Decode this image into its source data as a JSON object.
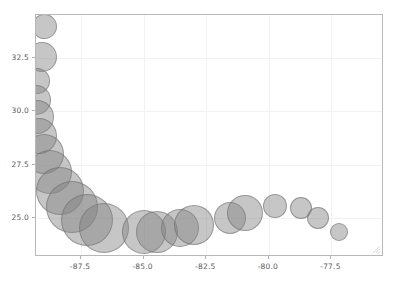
{
  "chart_data": {
    "type": "scatter",
    "title": "",
    "subtitle": "",
    "xlabel": "",
    "ylabel": "",
    "grid": true,
    "legend": false,
    "legend_position": "none",
    "marker_style": "bubble",
    "marker_color": "#808080",
    "marker_opacity": 0.45,
    "marker_edge_color": "#6e6e6e",
    "xlim": [
      -89.3,
      -75.4
    ],
    "ylim": [
      23.2,
      34.5
    ],
    "xticks": [
      -87.5,
      -85.0,
      -82.5,
      -80.0,
      -77.5
    ],
    "xticklabels": [
      "-87.5",
      "-85.0",
      "-82.5",
      "-80.0",
      "-77.5"
    ],
    "yticks": [
      25.0,
      27.5,
      30.0,
      32.5
    ],
    "yticklabels": [
      "25.0",
      "27.5",
      "30.0",
      "32.5"
    ],
    "size_units": "pixel-diameter",
    "points": [
      {
        "x": -88.95,
        "y": 33.95,
        "size": 25
      },
      {
        "x": -89.05,
        "y": 32.55,
        "size": 30
      },
      {
        "x": -89.25,
        "y": 31.4,
        "size": 26
      },
      {
        "x": -89.3,
        "y": 30.55,
        "size": 30
      },
      {
        "x": -89.25,
        "y": 29.75,
        "size": 34
      },
      {
        "x": -89.2,
        "y": 28.85,
        "size": 36
      },
      {
        "x": -89.0,
        "y": 28.0,
        "size": 40
      },
      {
        "x": -88.75,
        "y": 27.15,
        "size": 44
      },
      {
        "x": -88.35,
        "y": 26.3,
        "size": 48
      },
      {
        "x": -87.85,
        "y": 25.55,
        "size": 52
      },
      {
        "x": -87.25,
        "y": 24.95,
        "size": 52
      },
      {
        "x": -86.6,
        "y": 24.55,
        "size": 50
      },
      {
        "x": -85.0,
        "y": 24.35,
        "size": 44
      },
      {
        "x": -84.45,
        "y": 24.35,
        "size": 42
      },
      {
        "x": -83.55,
        "y": 24.55,
        "size": 38
      },
      {
        "x": -83.0,
        "y": 24.7,
        "size": 40
      },
      {
        "x": -81.55,
        "y": 25.0,
        "size": 32
      },
      {
        "x": -80.95,
        "y": 25.25,
        "size": 36
      },
      {
        "x": -79.75,
        "y": 25.6,
        "size": 24
      },
      {
        "x": -78.7,
        "y": 25.5,
        "size": 22
      },
      {
        "x": -78.05,
        "y": 25.0,
        "size": 22
      },
      {
        "x": -77.2,
        "y": 24.35,
        "size": 18
      }
    ]
  }
}
